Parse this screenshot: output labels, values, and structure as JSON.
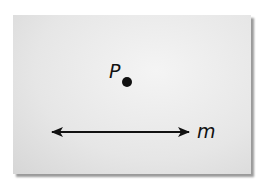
{
  "figure": {
    "point": {
      "label": "P",
      "cx": 127,
      "cy": 82,
      "r": 5
    },
    "line": {
      "label": "m",
      "x1": 49,
      "x2": 192,
      "y": 132,
      "arrows": "both"
    },
    "colors": {
      "ink": "#111111",
      "background": "#e6e6e6"
    }
  }
}
